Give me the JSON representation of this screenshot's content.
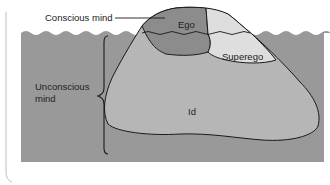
{
  "diagram": {
    "labels": {
      "conscious": "Conscious mind",
      "unconscious_line1": "Unconscious",
      "unconscious_line2": "mind",
      "ego": "Ego",
      "superego": "Superego",
      "id": "Id"
    },
    "colors": {
      "water": "#9a9a9a",
      "water_dark": "#8e8e8e",
      "id": "#b4b4b4",
      "ego": "#8a8a8a",
      "superego": "#dcdcdc",
      "outline": "#1a1a1a",
      "background": "#ffffff"
    }
  }
}
